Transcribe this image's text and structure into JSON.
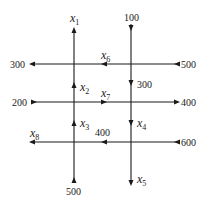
{
  "diagram": {
    "type": "traffic-flow-network",
    "streets": {
      "vertical": [
        {
          "id": "left",
          "x": 74
        },
        {
          "id": "right",
          "x": 131
        }
      ],
      "horizontal": [
        {
          "id": "top",
          "y": 64
        },
        {
          "id": "middle",
          "y": 102
        },
        {
          "id": "bottom",
          "y": 142
        }
      ]
    },
    "labels": {
      "x1": {
        "base": "x",
        "sub": "1"
      },
      "x2": {
        "base": "x",
        "sub": "2"
      },
      "x3": {
        "base": "x",
        "sub": "3"
      },
      "x4": {
        "base": "x",
        "sub": "4"
      },
      "x5": {
        "base": "x",
        "sub": "5"
      },
      "x6": {
        "base": "x",
        "sub": "6"
      },
      "x7": {
        "base": "x",
        "sub": "7"
      },
      "x8": {
        "base": "x",
        "sub": "8"
      }
    },
    "flows": {
      "top_right_in": "100",
      "top_left_out": "300",
      "top_right_in_h": "500",
      "right_mid_vertical": "300",
      "middle_left_in": "200",
      "middle_right_out": "400",
      "bottom_mid": "400",
      "bottom_right_in": "600",
      "left_bottom_in": "500"
    }
  }
}
